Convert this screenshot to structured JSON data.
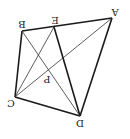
{
  "diagram": {
    "rotation_deg": 180,
    "stroke_color": "#1a1a1a",
    "labels": {
      "A": "A",
      "B": "B",
      "C": "C",
      "D": "D",
      "E": "E",
      "P": "P"
    },
    "points": {
      "A": [
        112,
        18
      ],
      "B": [
        22,
        31
      ],
      "E": [
        54,
        27
      ],
      "C": [
        15,
        97
      ],
      "D": [
        80,
        116
      ],
      "P": [
        49,
        72
      ]
    },
    "segments": [
      {
        "from": "A",
        "to": "B",
        "weight": "thick"
      },
      {
        "from": "B",
        "to": "C",
        "weight": "thick"
      },
      {
        "from": "C",
        "to": "D",
        "weight": "thick"
      },
      {
        "from": "D",
        "to": "A",
        "weight": "thick"
      },
      {
        "from": "E",
        "to": "D",
        "weight": "thick"
      },
      {
        "from": "A",
        "to": "C",
        "weight": "thin"
      },
      {
        "from": "B",
        "to": "D",
        "weight": "thin"
      },
      {
        "from": "E",
        "to": "C",
        "weight": "thin"
      }
    ]
  }
}
